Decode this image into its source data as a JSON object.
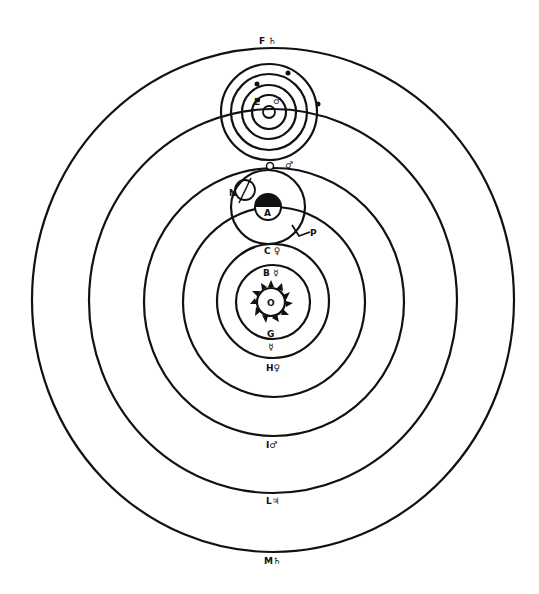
{
  "diagram": {
    "type": "geo-heliocentric planetary system (Tychonic-style orbit diagram)",
    "colors": {
      "ink": "#111111",
      "background": "#ffffff"
    },
    "labels": {
      "outer_top": "F ♄",
      "sun": "O",
      "mercury_top": "B ☿",
      "mercury_bottom": "G",
      "mercury_bottom_symbol": "☿",
      "venus_top": "C ♀",
      "venus_bottom": "H♀",
      "earth": "A",
      "moon_node": "N",
      "moon_point": "P",
      "mars_top_marker": "♂",
      "mars_bottom": "I♂",
      "jupiter_bottom": "L♃",
      "saturn_bottom": "M♄",
      "top_system_E": "E",
      "top_system_symbol": "♂"
    },
    "orbits": [
      {
        "name": "saturn-orbit",
        "rx": 241,
        "ry": 252
      },
      {
        "name": "jupiter-orbit",
        "rx": 184,
        "ry": 192
      },
      {
        "name": "mars-orbit",
        "rx": 130,
        "ry": 134
      },
      {
        "name": "earth-orbit",
        "rx": 91,
        "ry": 95
      },
      {
        "name": "venus-orbit",
        "rx": 56,
        "ry": 57
      },
      {
        "name": "mercury-orbit",
        "rx": 37,
        "ry": 37
      }
    ]
  }
}
